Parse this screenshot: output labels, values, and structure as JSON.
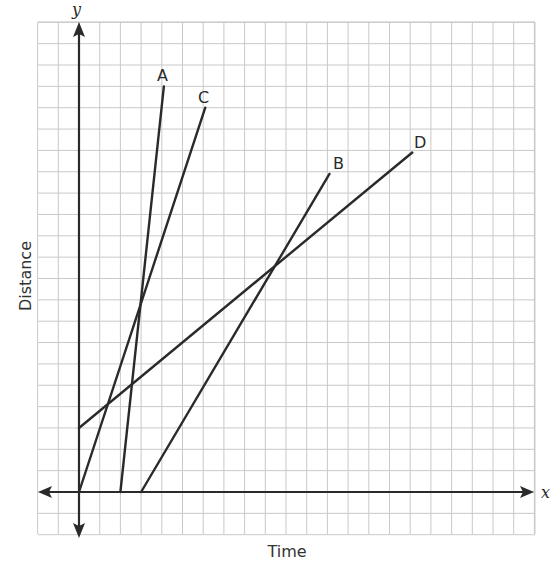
{
  "chart_data": {
    "type": "line",
    "title": "",
    "xlabel": "Time",
    "ylabel": "Distance",
    "x_axis_variable": "x",
    "y_axis_variable": "y",
    "grid": true,
    "tick_labels": false,
    "grid_extent": {
      "x": [
        -2,
        22
      ],
      "y": [
        -2,
        22
      ]
    },
    "series": [
      {
        "name": "A",
        "points": [
          [
            2,
            0
          ],
          [
            4.1,
            19.0
          ]
        ]
      },
      {
        "name": "B",
        "points": [
          [
            3,
            0
          ],
          [
            12.1,
            14.9
          ]
        ]
      },
      {
        "name": "C",
        "points": [
          [
            0,
            0
          ],
          [
            6.1,
            18.0
          ]
        ]
      },
      {
        "name": "D",
        "points": [
          [
            0,
            3
          ],
          [
            16.1,
            15.9
          ]
        ]
      }
    ],
    "intersections": [
      {
        "lines": [
          "A",
          "C"
        ],
        "approx": [
          3.0,
          9.0
        ]
      },
      {
        "lines": [
          "B",
          "D"
        ],
        "approx": [
          9.2,
          10.4
        ]
      }
    ]
  },
  "labels": {
    "xlabel": "Time",
    "ylabel": "Distance",
    "x_var": "x",
    "y_var": "y",
    "A": "A",
    "B": "B",
    "C": "C",
    "D": "D"
  }
}
